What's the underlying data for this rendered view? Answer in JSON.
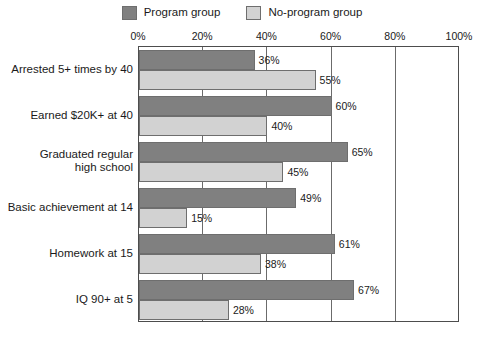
{
  "legend": {
    "entries": [
      {
        "label": "Program group",
        "color": "#808080",
        "icon": "legend-swatch-icon"
      },
      {
        "label": "No-program group",
        "color": "#d2d2d2",
        "icon": "legend-swatch-icon"
      }
    ]
  },
  "axis": {
    "ticks": [
      "0%",
      "20%",
      "40%",
      "60%",
      "80%",
      "100%"
    ]
  },
  "chart_data": {
    "type": "bar",
    "orientation": "horizontal",
    "title": "",
    "subtitle": "",
    "xlabel": "",
    "ylabel": "",
    "xlim": [
      0,
      100
    ],
    "xticks": [
      0,
      20,
      40,
      60,
      80,
      100
    ],
    "xtick_labels": [
      "0%",
      "20%",
      "40%",
      "60%",
      "80%",
      "100%"
    ],
    "grid": true,
    "grid_axis": "x",
    "legend_position": "top-center",
    "categories": [
      "Arrested 5+ times by 40",
      "Earned $20K+ at 40",
      "Graduated regular high school",
      "Basic achievement at 14",
      "Homework at 15",
      "IQ 90+ at 5"
    ],
    "category_lines": [
      [
        "Arrested 5+ times by 40"
      ],
      [
        "Earned $20K+ at 40"
      ],
      [
        "Graduated regular",
        "high school"
      ],
      [
        "Basic achievement at 14"
      ],
      [
        "Homework at 15"
      ],
      [
        "IQ 90+ at 5"
      ]
    ],
    "series": [
      {
        "name": "Program group",
        "color": "#808080",
        "values": [
          36,
          60,
          65,
          49,
          61,
          67
        ],
        "labels": [
          "36%",
          "60%",
          "65%",
          "49%",
          "61%",
          "67%"
        ]
      },
      {
        "name": "No-program group",
        "color": "#d2d2d2",
        "values": [
          55,
          40,
          45,
          15,
          38,
          28
        ],
        "labels": [
          "55%",
          "40%",
          "45%",
          "15%",
          "38%",
          "28%"
        ]
      }
    ]
  }
}
